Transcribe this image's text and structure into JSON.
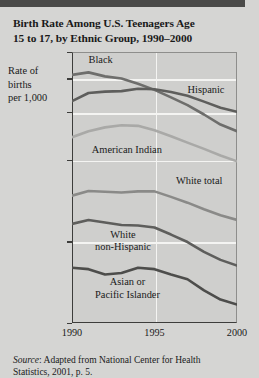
{
  "figure": {
    "title_line1": "Birth Rate Among U.S. Teenagers Age",
    "title_line2": "15 to 17, by Ethnic Group, 1990–2000",
    "axis_label_line1": "Rate of",
    "axis_label_line2": "births",
    "axis_label_line3": "per 1,000",
    "source_prefix": "Source",
    "source_text": ": Adapted from National Center for",
    "source_text2": "Health Statistics, 2001, p. 5."
  },
  "chart_data": {
    "type": "line",
    "title": "Birth Rate Among U.S. Teenagers Age 15 to 17, by Ethnic Group, 1990–2000",
    "xlabel": "",
    "ylabel": "Rate of births per 1,000",
    "yscale": "log",
    "ylim": [
      10,
      100
    ],
    "xlim": [
      1990,
      2000
    ],
    "grid": true,
    "legend_position": "inline-labels",
    "ytick_labels": [
      "100",
      "80",
      "60",
      "40",
      "20",
      "10"
    ],
    "ytick_values": [
      100,
      80,
      60,
      40,
      20,
      10
    ],
    "xtick_labels": [
      "1990",
      "1995",
      "2000"
    ],
    "xtick_values": [
      1990,
      1995,
      2000
    ],
    "x": [
      1990,
      1991,
      1992,
      1993,
      1994,
      1995,
      1996,
      1997,
      1998,
      1999,
      2000
    ],
    "series": [
      {
        "name": "Black",
        "color": "#6e6e6c",
        "width": 2.6,
        "values": [
          82.3,
          84.1,
          81.3,
          79.8,
          76.3,
          72.5,
          68.0,
          63.7,
          58.8,
          54.0,
          51.0
        ]
      },
      {
        "name": "Hispanic",
        "color": "#5e5e5c",
        "width": 2.6,
        "values": [
          65.9,
          70.6,
          71.4,
          71.7,
          73.2,
          72.9,
          71.2,
          68.9,
          65.6,
          62.3,
          60.2
        ]
      },
      {
        "name": "American Indian",
        "color": "#a9a9a7",
        "width": 2.6,
        "values": [
          48.5,
          51.0,
          52.7,
          53.7,
          53.4,
          51.4,
          48.9,
          46.3,
          43.9,
          41.5,
          39.5
        ]
      },
      {
        "name": "White total",
        "color": "#8a8a88",
        "width": 2.6,
        "values": [
          29.5,
          30.7,
          30.5,
          30.3,
          30.6,
          30.6,
          29.2,
          27.8,
          26.3,
          25.0,
          24.0
        ]
      },
      {
        "name": "White non-Hispanic",
        "color": "#5e5e5c",
        "width": 2.6,
        "values": [
          23.2,
          24.0,
          23.5,
          23.0,
          22.9,
          22.5,
          21.2,
          19.9,
          18.3,
          17.1,
          16.3
        ]
      },
      {
        "name": "Asian or Pacific Islander",
        "color": "#4d4d4b",
        "width": 2.6,
        "values": [
          16.0,
          15.8,
          15.1,
          15.3,
          16.0,
          15.8,
          15.1,
          14.5,
          13.2,
          12.2,
          11.7
        ]
      }
    ],
    "annotations": [
      {
        "text": "Black",
        "x": 1991.0,
        "y": 93
      },
      {
        "text": "Hispanic",
        "x": 1997.0,
        "y": 72
      },
      {
        "text": "American Indian",
        "x": 1991.2,
        "y": 43
      },
      {
        "text": "White total",
        "x": 1996.3,
        "y": 33
      },
      {
        "text": "White non-Hispanic",
        "x": 1992.0,
        "y": 21
      },
      {
        "text": "Asian or Pacific Islander",
        "x": 1992.0,
        "y": 14
      }
    ]
  },
  "labels": {
    "black": "Black",
    "hispanic": "Hispanic",
    "american_indian": "American Indian",
    "white_total": "White total",
    "white_non_hispanic_1": "White",
    "white_non_hispanic_2": "non-Hispanic",
    "asian_1": "Asian or",
    "asian_2": "Pacific Islander"
  }
}
